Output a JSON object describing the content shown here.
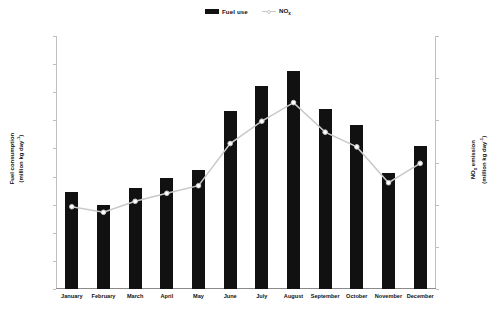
{
  "legend": {
    "items": [
      {
        "label": "Fuel use",
        "marker": "bar-swatch-icon",
        "color": "#111111"
      },
      {
        "label": "NO",
        "subscript": "x",
        "marker": "line-marker-icon",
        "color": "#c9c9c9"
      }
    ]
  },
  "axes": {
    "left_title_line1": "Fuel consumption",
    "left_title_line2": "(million kg day",
    "left_title_sup": "-1",
    "left_title_line2_end": ")",
    "right_title_line1": "NO",
    "right_title_sub": "x",
    "right_title_line1_end": " emission",
    "right_title_line2": "(million kg day",
    "right_title_sup": "-1",
    "right_title_line2_end": ")"
  },
  "chart_data": {
    "type": "bar",
    "title": "",
    "xlabel": "",
    "ylabel": "Fuel consumption (million kg day-1)",
    "y2label": "NOx emission (million kg day-1)",
    "categories": [
      "January",
      "February",
      "March",
      "April",
      "May",
      "June",
      "July",
      "August",
      "September",
      "October",
      "November",
      "December"
    ],
    "ylim": [
      325,
      370
    ],
    "yticks": [
      325,
      330,
      335,
      340,
      345,
      350,
      355,
      360,
      365,
      370
    ],
    "y2lim": [
      4.3,
      4.9
    ],
    "y2ticks": [
      4.3,
      4.4,
      4.5,
      4.6,
      4.7,
      4.8,
      4.9
    ],
    "grid": false,
    "legend_position": "top-center",
    "series": [
      {
        "name": "Fuel use",
        "type": "bar",
        "axis": "left",
        "color": "#111111",
        "values": [
          342.3,
          340.0,
          343.0,
          344.7,
          346.2,
          356.6,
          361.1,
          363.8,
          357.0,
          354.1,
          345.7,
          350.5
        ]
      },
      {
        "name": "NOx",
        "type": "line",
        "axis": "right",
        "color": "#c9c9c9",
        "marker": "circle",
        "values": [
          4.495,
          4.482,
          4.508,
          4.527,
          4.545,
          4.645,
          4.698,
          4.742,
          4.672,
          4.637,
          4.552,
          4.598
        ]
      }
    ]
  }
}
